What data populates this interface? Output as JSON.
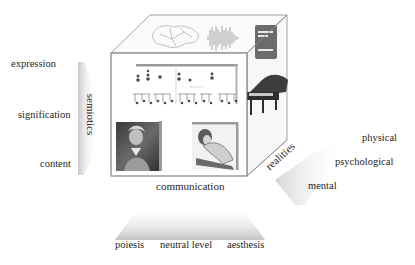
{
  "diagram": {
    "type": "3d-cube-model",
    "axes": {
      "semiotics": {
        "label": "semiotics",
        "levels": [
          "expression",
          "signification",
          "content"
        ]
      },
      "communication": {
        "label": "communication",
        "levels": [
          "poiesis",
          "neutral level",
          "aesthesis"
        ]
      },
      "realities": {
        "label": "realities",
        "levels": [
          "physical",
          "psychological",
          "mental"
        ]
      }
    },
    "cube_contents": {
      "top_face": [
        "brain-outline-drawing",
        "sound-waveform",
        "digital-device"
      ],
      "front_face": [
        "musical-score",
        "composer-portrait",
        "listener-engraving"
      ],
      "right_face": [
        "grand-piano"
      ]
    },
    "colors": {
      "edge": "#8a8a8a",
      "shade": "#d9d9d9",
      "device": "#6b6b6b"
    }
  }
}
